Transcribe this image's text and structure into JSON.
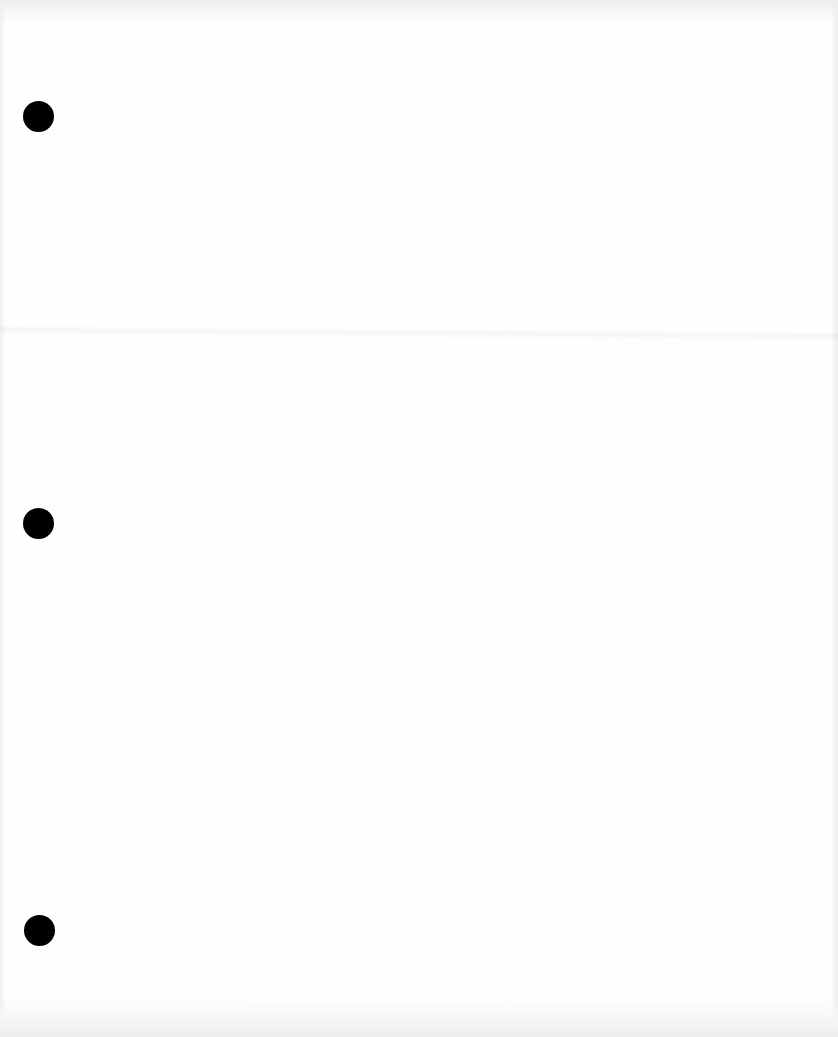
{
  "document": {
    "type": "blank scanned page",
    "text": "",
    "background_color": "#fefefe",
    "binder_holes": [
      {
        "cx": 38,
        "cy": 116,
        "diameter": 31,
        "color": "#000000"
      },
      {
        "cx": 38,
        "cy": 523,
        "diameter": 31,
        "color": "#000000"
      },
      {
        "cx": 39,
        "cy": 930,
        "diameter": 31,
        "color": "#000000"
      }
    ],
    "fold_crease_y": 330
  }
}
